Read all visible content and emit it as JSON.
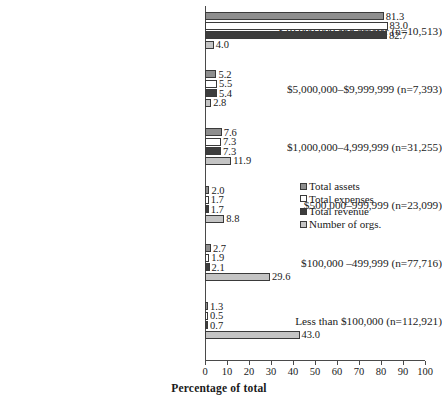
{
  "chart_data": {
    "type": "bar",
    "orientation": "horizontal",
    "title": "",
    "xlabel": "Percentage of total",
    "ylabel": "",
    "xlim": [
      0,
      100
    ],
    "xticks": [
      0,
      10,
      20,
      30,
      40,
      50,
      60,
      70,
      80,
      90,
      100
    ],
    "grid": false,
    "legend_position": "center-right",
    "categories": [
      "$10,000,000 and greater (n=10,513)",
      "$5,000,000–$9,999,999 (n=7,393)",
      "$1,000,000–4,999,999 (n=31,255)",
      "$500,000–999,999 (n=23,099)",
      "$100,000 –499,999 (n=77,716)",
      "Less than $100,000 (n=112,921)"
    ],
    "series": [
      {
        "name": "Total assets",
        "key": "assets",
        "color": "#8e8e8e",
        "values": [
          81.3,
          5.2,
          7.6,
          2.0,
          2.7,
          1.3
        ],
        "labels": [
          "81.3",
          "5.2",
          "7.6",
          "2.0",
          "2.7",
          "1.3"
        ]
      },
      {
        "name": "Total expenses",
        "key": "expenses",
        "color": "#ffffff",
        "values": [
          83.0,
          5.5,
          7.3,
          1.7,
          1.9,
          0.5
        ],
        "labels": [
          "83.0",
          "5.5",
          "7.3",
          "1.7",
          "1.9",
          "0.5"
        ]
      },
      {
        "name": "Total revenue",
        "key": "revenue",
        "color": "#3d3d3d",
        "values": [
          82.7,
          5.4,
          7.3,
          1.7,
          2.1,
          0.7
        ],
        "labels": [
          "82.7",
          "5.4",
          "7.3",
          "1.7",
          "2.1",
          "0.7"
        ]
      },
      {
        "name": "Number of orgs.",
        "key": "orgs",
        "color": "#c4c4c4",
        "values": [
          4.0,
          2.8,
          11.9,
          8.8,
          29.6,
          43.0
        ],
        "labels": [
          "4.0",
          "2.8",
          "11.9",
          "8.8",
          "29.6",
          "43.0"
        ]
      }
    ]
  },
  "axis": {
    "x_title": "Percentage of total",
    "tick_labels": [
      "0",
      "10",
      "20",
      "30",
      "40",
      "50",
      "60",
      "70",
      "80",
      "90",
      "100"
    ]
  },
  "legend": {
    "items": [
      {
        "label": "Total assets",
        "key": "assets"
      },
      {
        "label": "Total expenses",
        "key": "expenses"
      },
      {
        "label": "Total revenue",
        "key": "revenue"
      },
      {
        "label": "Number of orgs.",
        "key": "orgs"
      }
    ]
  }
}
